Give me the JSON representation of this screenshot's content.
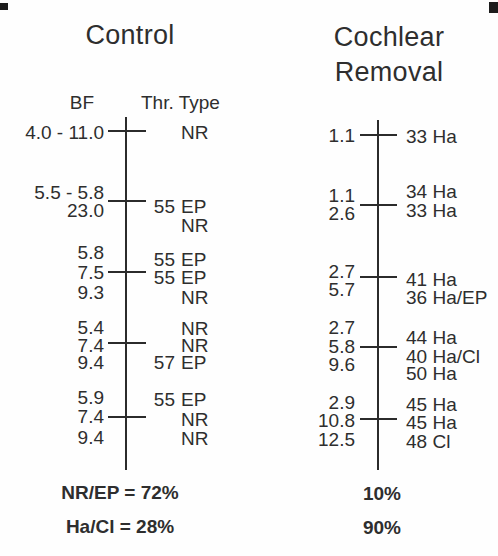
{
  "figure": {
    "ink_color": "#2b2b2b",
    "background_color": "#fefefe"
  },
  "control": {
    "title": "Control",
    "header_bf": "BF",
    "header_thr_type": "Thr. Type",
    "bf_values": [
      "4.0 - 11.0",
      "5.5 - 5.8",
      "23.0",
      "5.8",
      "7.5",
      "9.3",
      "5.4",
      "7.4",
      "9.4",
      "5.9",
      "7.4",
      "9.4"
    ],
    "entries": [
      {
        "thr": "",
        "type": "NR"
      },
      {
        "thr": "55",
        "type": "EP"
      },
      {
        "thr": "",
        "type": "NR"
      },
      {
        "thr": "55",
        "type": "EP"
      },
      {
        "thr": "55",
        "type": "EP"
      },
      {
        "thr": "",
        "type": "NR"
      },
      {
        "thr": "",
        "type": "NR"
      },
      {
        "thr": "",
        "type": "NR"
      },
      {
        "thr": "57",
        "type": "EP"
      },
      {
        "thr": "55",
        "type": "EP"
      },
      {
        "thr": "",
        "type": "NR"
      },
      {
        "thr": "",
        "type": "NR"
      }
    ],
    "summary_line1": "NR/EP = 72%",
    "summary_line2": "Ha/Cl = 28%"
  },
  "cochlear_removal": {
    "title_line1": "Cochlear",
    "title_line2": "Removal",
    "bf_values": [
      "1.1",
      "1.1",
      "2.6",
      "2.7",
      "5.7",
      "2.7",
      "5.8",
      "9.6",
      "2.9",
      "10.8",
      "12.5"
    ],
    "entries": [
      "33 Ha",
      "34 Ha",
      "33 Ha",
      "41 Ha",
      "36 Ha/EP",
      "44 Ha",
      "40 Ha/Cl",
      "50 Ha",
      "45 Ha",
      "45 Ha",
      "48 Cl"
    ],
    "summary_line1": "10%",
    "summary_line2": "90%"
  }
}
